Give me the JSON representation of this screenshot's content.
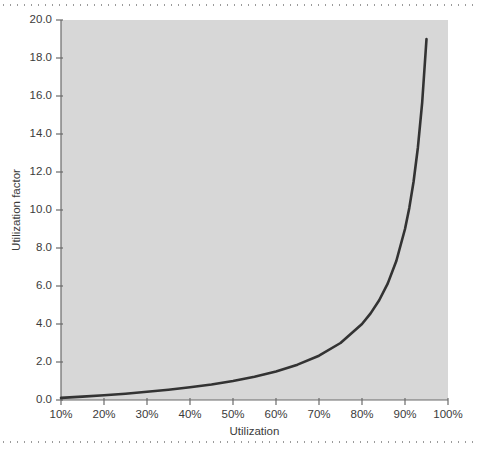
{
  "page": {
    "background_color": "#ffffff",
    "rule_top_label": "top-dotted-rule",
    "rule_bottom_label": "bottom-dotted-rule"
  },
  "chart_data": {
    "type": "line",
    "title": "",
    "subtitle": "",
    "xlabel": "Utilization",
    "ylabel": "Utilization factor",
    "xlim": [
      10,
      100
    ],
    "ylim": [
      0.0,
      20.0
    ],
    "grid": false,
    "legend": null,
    "plot_background_color": "#d7d7d7",
    "line_color": "#333333",
    "line_width": 2.6,
    "x_tick_labels": [
      "10%",
      "20%",
      "30%",
      "40%",
      "50%",
      "60%",
      "70%",
      "80%",
      "90%",
      "100%"
    ],
    "x_tick_values": [
      10,
      20,
      30,
      40,
      50,
      60,
      70,
      80,
      90,
      100
    ],
    "y_tick_labels": [
      "0.0",
      "2.0",
      "4.0",
      "6.0",
      "8.0",
      "10.0",
      "12.0",
      "14.0",
      "16.0",
      "18.0",
      "20.0"
    ],
    "y_tick_values": [
      0.0,
      2.0,
      4.0,
      6.0,
      8.0,
      10.0,
      12.0,
      14.0,
      16.0,
      18.0,
      20.0
    ],
    "series": [
      {
        "name": "Utilization factor",
        "formula": "u / (1 - u)",
        "x": [
          10,
          15,
          20,
          25,
          30,
          35,
          40,
          45,
          50,
          55,
          60,
          65,
          70,
          75,
          80,
          82,
          84,
          86,
          88,
          90,
          91,
          92,
          93,
          94,
          95
        ],
        "y": [
          0.11,
          0.18,
          0.25,
          0.33,
          0.43,
          0.54,
          0.67,
          0.82,
          1.0,
          1.22,
          1.5,
          1.86,
          2.33,
          3.0,
          4.0,
          4.56,
          5.25,
          6.14,
          7.33,
          9.0,
          10.11,
          11.5,
          13.29,
          15.67,
          19.0
        ]
      }
    ],
    "annotations": []
  }
}
